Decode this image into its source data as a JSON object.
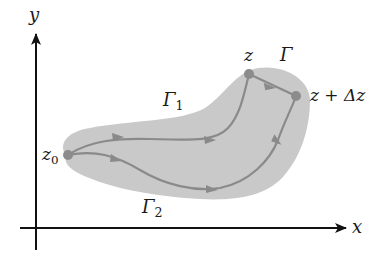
{
  "diagram": {
    "type": "complex-plane-path-independence",
    "colors": {
      "region_fill": "#c9c9c9",
      "path_stroke": "#8a8a8a",
      "point_fill": "#8c8c8c",
      "axis": "#111111",
      "text": "#1a1a1a"
    },
    "axes": {
      "x_label": "x",
      "y_label": "y"
    },
    "points": {
      "start": "z",
      "start_sub": "0",
      "mid": "z",
      "end_prefix": "z + ",
      "end_delta": "Δz"
    },
    "paths": {
      "gamma": "Γ",
      "gamma1": "Γ",
      "gamma1_sub": "1",
      "gamma2": "Γ",
      "gamma2_sub": "2"
    }
  }
}
